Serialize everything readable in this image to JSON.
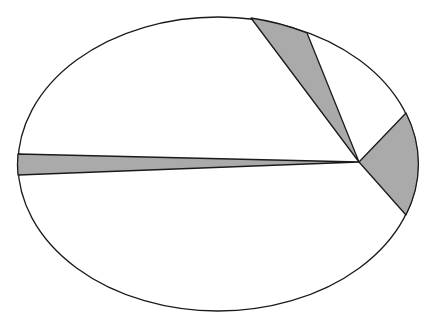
{
  "diagram": {
    "shape": "ellipse",
    "ellipse": {
      "cx": 218,
      "cy": 164,
      "rx": 200,
      "ry": 147
    },
    "hub": {
      "x": 359,
      "y": 162
    },
    "colors": {
      "fill_light": "#ffffff",
      "fill_shaded": "#aaaaaa",
      "stroke": "#1a1a1a"
    },
    "wedges": [
      {
        "name": "top-wedge",
        "shaded": true,
        "p1": [
          251,
          18
        ],
        "p2": [
          307,
          33
        ]
      },
      {
        "name": "right-wedge",
        "shaded": true,
        "p1": [
          406,
          113
        ],
        "p2": [
          406,
          215
        ]
      },
      {
        "name": "left-wedge",
        "shaded": true,
        "p1": [
          18,
          154
        ],
        "p2": [
          18,
          175
        ]
      }
    ]
  }
}
